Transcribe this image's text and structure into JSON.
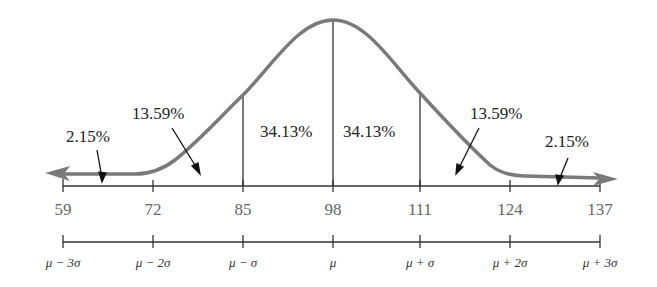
{
  "diagram": {
    "mean": 98,
    "sd": 13,
    "curve_color": "#7a7a7a",
    "line_color": "#222222",
    "x_values": [
      {
        "label": "59",
        "x": 63
      },
      {
        "label": "72",
        "x": 153
      },
      {
        "label": "85",
        "x": 243
      },
      {
        "label": "98",
        "x": 333
      },
      {
        "label": "111",
        "x": 420
      },
      {
        "label": "124",
        "x": 510
      },
      {
        "label": "137",
        "x": 600
      }
    ],
    "sigma_labels": [
      {
        "label": "μ − 3σ",
        "x": 63
      },
      {
        "label": "μ − 2σ",
        "x": 153
      },
      {
        "label": "μ − σ",
        "x": 243
      },
      {
        "label": "μ",
        "x": 333
      },
      {
        "label": "μ + σ",
        "x": 420
      },
      {
        "label": "μ + 2σ",
        "x": 510
      },
      {
        "label": "μ + 3σ",
        "x": 600
      }
    ],
    "regions": {
      "left_tail": "2.15%",
      "left_two_sd": "13.59%",
      "left_one_sd": "34.13%",
      "right_one_sd": "34.13%",
      "right_two_sd": "13.59%",
      "right_tail": "2.15%"
    }
  }
}
